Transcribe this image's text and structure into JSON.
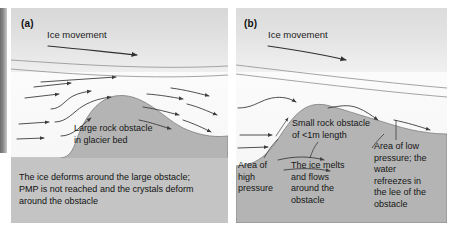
{
  "figure": {
    "type": "two-panel-diagram"
  },
  "panel_a": {
    "label": "(a)",
    "ice_movement_label": "Ice movement",
    "obstacle_label": "Large rock obstacle\nin glacier bed",
    "obstacle_label_line1": "Large rock obstacle",
    "obstacle_label_line2": "in glacier bed",
    "caption": "The ice deforms around the large obstacle; PMP is not reached and the crystals deform around the obstacle",
    "caption_line1": "The ice deforms around the large obstacle;",
    "caption_line2": "PMP is not reached and the crystals deform",
    "caption_line3": "around the obstacle"
  },
  "panel_b": {
    "label": "(b)",
    "ice_movement_label": "Ice movement",
    "obstacle_label_line1": "Small rock obstacle",
    "obstacle_label_line2": "of <1m length",
    "high_pressure_label": "Area of high pressure",
    "high_pressure_line1": "Area of",
    "high_pressure_line2": "high",
    "high_pressure_line3": "pressure",
    "melt_label": "The ice melts and flows around the obstacle",
    "melt_line1": "The ice melts",
    "melt_line2": "and flows",
    "melt_line3": "around the",
    "melt_line4": "obstacle",
    "low_pressure_label": "Area of low pressure; the water refreezes in the lee of the obstacle",
    "low_pressure_line1": "Area of low",
    "low_pressure_line2": "pressure; the",
    "low_pressure_line3": "water",
    "low_pressure_line4": "refreezes in",
    "low_pressure_line5": "the lee of the",
    "low_pressure_line6": "obstacle"
  },
  "colors": {
    "rock_fill": "#b4b4b4",
    "rock_stroke": "#7e7e7e",
    "caption_band": "#c4c4c4",
    "sky_top": "#d8d8d8",
    "ice_fill": "#fbfbfb",
    "arrow": "#3c3c3c",
    "text": "#141414",
    "page_spine": "#6d6d6d"
  }
}
